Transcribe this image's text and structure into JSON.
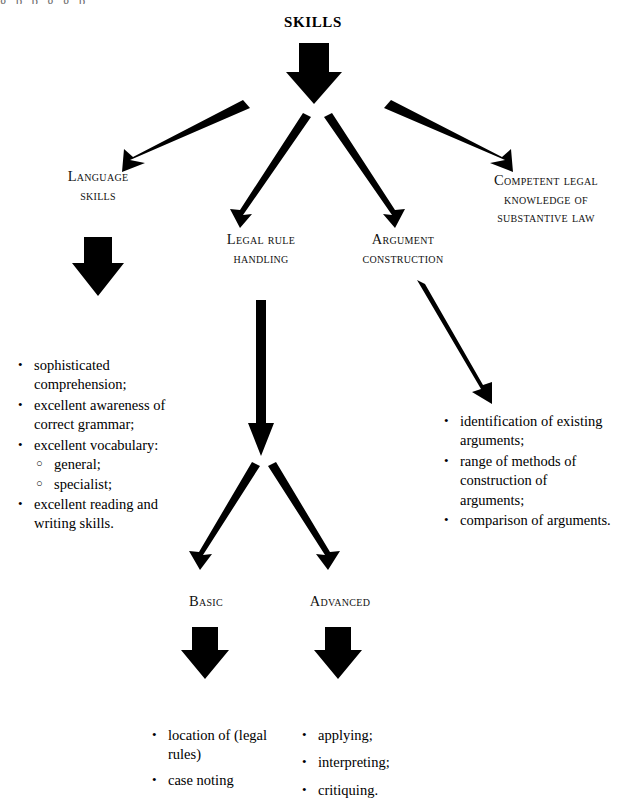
{
  "diagram": {
    "title": "SKILLS",
    "top_clipped_text": "g          p          p      g      g      p",
    "nodes": {
      "language_skills": [
        "Language",
        "skills"
      ],
      "legal_rule_handling": [
        "Legal rule",
        "handling"
      ],
      "argument_construction": [
        "Argument",
        "construction"
      ],
      "competent_legal_knowledge": [
        "Competent legal",
        "knowledge of",
        "substantive law"
      ],
      "basic": [
        "Basic"
      ],
      "advanced": [
        "Advanced"
      ]
    },
    "lists": {
      "language_skills_items": [
        {
          "text": "sophisticated comprehension;",
          "bullet": "•"
        },
        {
          "text": "excellent awareness of correct grammar;",
          "bullet": "•"
        },
        {
          "text": "excellent vocabulary:",
          "bullet": "•",
          "subitems": [
            {
              "text": "general;",
              "bullet": "○"
            },
            {
              "text": "specialist;",
              "bullet": "○"
            }
          ]
        },
        {
          "text": "excellent reading and writing skills.",
          "bullet": "•"
        }
      ],
      "argument_construction_items": [
        {
          "text": "identification of existing arguments;",
          "bullet": "•"
        },
        {
          "text": "range of methods of construction of arguments;",
          "bullet": "•"
        },
        {
          "text": "comparison of arguments.",
          "bullet": "•"
        }
      ],
      "basic_items": [
        {
          "text": "location of (legal rules)",
          "bullet": "•"
        },
        {
          "text": "case noting",
          "bullet": "•"
        }
      ],
      "advanced_items": [
        {
          "text": "applying;",
          "bullet": "•"
        },
        {
          "text": "interpreting;",
          "bullet": "•"
        },
        {
          "text": "critiquing.",
          "bullet": "•"
        }
      ]
    },
    "colors": {
      "ink": "#000000",
      "background": "#ffffff",
      "text": "#111111"
    },
    "arrow_count": {
      "block_arrows": 4,
      "line_arrows": 6
    }
  }
}
